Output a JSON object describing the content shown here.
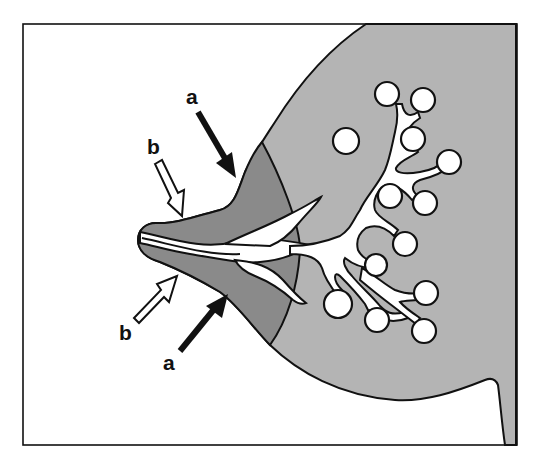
{
  "diagram": {
    "type": "anatomical illustration",
    "colors": {
      "background": "#ffffff",
      "breast_tissue": "#b4b4b4",
      "areola": "#8a8a8a",
      "ducts_alveoli": "#ffffff",
      "outline": "#111111"
    },
    "labels": {
      "a_top": "a",
      "a_bottom": "a",
      "b_top": "b",
      "b_bottom": "b"
    },
    "arrows": [
      {
        "label": "a",
        "style": "solid-black",
        "points_to": "areola (upper)"
      },
      {
        "label": "a",
        "style": "solid-black",
        "points_to": "areola (lower)"
      },
      {
        "label": "b",
        "style": "hollow-white",
        "points_to": "nipple (upper)"
      },
      {
        "label": "b",
        "style": "hollow-white",
        "points_to": "nipple (lower)"
      }
    ],
    "alveoli_count": 14
  }
}
